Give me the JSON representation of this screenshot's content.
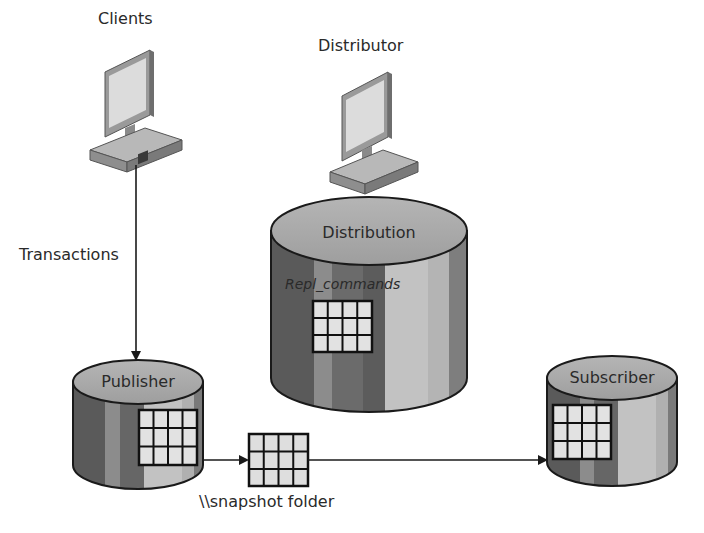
{
  "diagram": {
    "nodes": {
      "clients": {
        "label": "Clients",
        "icon": "computer-icon"
      },
      "distributor": {
        "label": "Distributor",
        "icon": "computer-icon"
      },
      "distribution_db": {
        "label": "Distribution",
        "table_label": "Repl_commands",
        "icon": "database-cylinder-icon"
      },
      "publisher_db": {
        "label": "Publisher",
        "icon": "database-cylinder-icon"
      },
      "subscriber_db": {
        "label": "Subscriber",
        "icon": "database-cylinder-icon"
      },
      "snapshot": {
        "label": "\\\\snapshot folder",
        "icon": "table-grid-icon"
      }
    },
    "edges": [
      {
        "from": "clients",
        "to": "publisher_db",
        "label": "Transactions"
      },
      {
        "from": "publisher_db",
        "to": "snapshot",
        "label": ""
      },
      {
        "from": "snapshot",
        "to": "subscriber_db",
        "label": ""
      }
    ],
    "colors": {
      "cylinder_top": "#a9a9a9",
      "stripe_dark": "#5e5e5e",
      "stripe_mid": "#8a8a8a",
      "stripe_light": "#c4c4c4",
      "grid_cell": "#e4e4e4",
      "outline": "#1a1a1a"
    }
  }
}
